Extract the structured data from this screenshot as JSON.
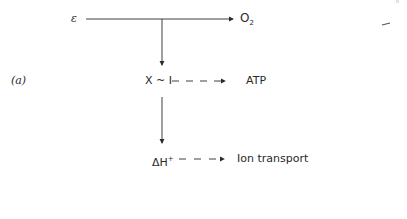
{
  "figure": {
    "panel_label": "(a)",
    "nodes": {
      "source": "ε",
      "oxygen": "O",
      "oxygen_subscript": "2",
      "intermediate": "X ~ I",
      "atp": "ATP",
      "proton_gradient": "ΔH",
      "proton_gradient_superscript": "+",
      "ion_transport": "Ion transport"
    },
    "page_fragment": "ᵢᵢ",
    "edges": [
      {
        "from": "source",
        "to": "oxygen",
        "style": "solid"
      },
      {
        "from": "source",
        "to": "intermediate",
        "style": "solid"
      },
      {
        "from": "intermediate",
        "to": "atp",
        "style": "dashed"
      },
      {
        "from": "intermediate",
        "to": "proton_gradient",
        "style": "solid"
      },
      {
        "from": "proton_gradient",
        "to": "ion_transport",
        "style": "dashed"
      }
    ]
  }
}
